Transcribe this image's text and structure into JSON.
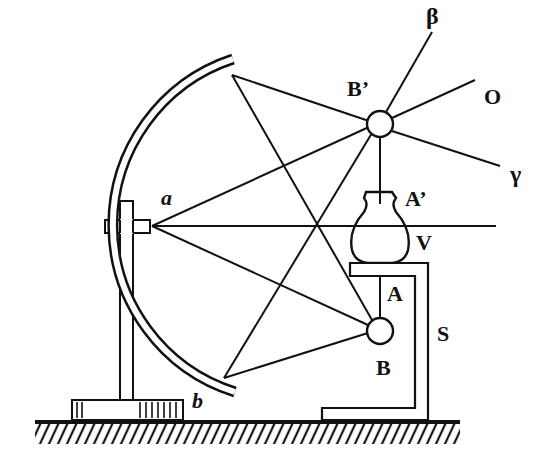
{
  "diagram": {
    "colors": {
      "ink": "#111111",
      "background": "#ffffff"
    },
    "labels": {
      "beta": "β",
      "O": "O",
      "gamma": "γ",
      "B_prime": "B’",
      "A_prime": "A’",
      "V": "V",
      "A": "A",
      "S": "S",
      "B": "B",
      "a": "a",
      "b": "b"
    },
    "components": {
      "mirror": "concave spherical mirror (edge a to b)",
      "object_bulb": "B",
      "image_bulb": "B’",
      "vase": "V",
      "stand": "S",
      "object_rod": "A",
      "image_rod": "A’",
      "rays_from_image": [
        "β",
        "O",
        "γ"
      ]
    }
  }
}
